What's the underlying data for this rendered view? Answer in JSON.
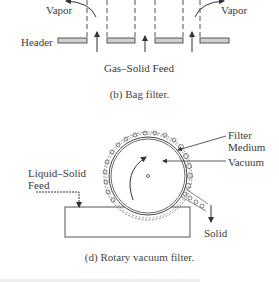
{
  "bag_filter": {
    "labels": {
      "vapor_left": "Vapor",
      "vapor_right": "Vapor",
      "header": "Header",
      "feed": "Gas–Solid Feed"
    },
    "caption": "(b) Bag filter."
  },
  "rotary_filter": {
    "labels": {
      "filter_medium_line1": "Filter",
      "filter_medium_line2": "Medium",
      "vacuum": "Vacuum",
      "feed_line1": "Liquid–Solid",
      "feed_line2": "Feed",
      "solid": "Solid"
    },
    "caption": "(d) Rotary vacuum filter."
  },
  "colors": {
    "line": "#444444",
    "header_fill": "#cfcfcf",
    "background": "#ffffff"
  }
}
